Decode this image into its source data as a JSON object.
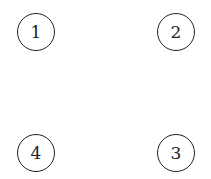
{
  "diagram": {
    "nodes": [
      {
        "label": "1",
        "cx": 36,
        "cy": 32
      },
      {
        "label": "2",
        "cx": 176,
        "cy": 32
      },
      {
        "label": "3",
        "cx": 176,
        "cy": 153
      },
      {
        "label": "4",
        "cx": 36,
        "cy": 153
      }
    ],
    "edges": [],
    "stroke_color": "#222222",
    "background": "#ffffff"
  }
}
